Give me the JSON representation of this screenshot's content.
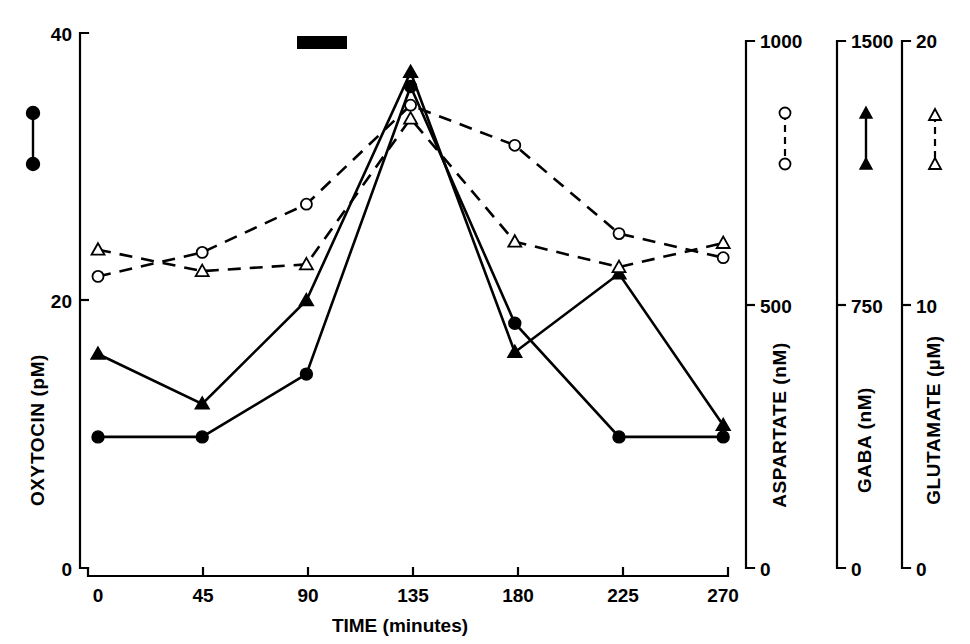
{
  "chart_data": {
    "type": "line",
    "title": "",
    "xlabel": "TIME (minutes)",
    "x": [
      0,
      45,
      90,
      135,
      180,
      225,
      270
    ],
    "xlim": [
      0,
      270
    ],
    "x_ticks": [
      "0",
      "45",
      "90",
      "135",
      "180",
      "225",
      "270"
    ],
    "grid": false,
    "legend_position": "inline-markers",
    "annotations": [
      {
        "name": "stimulation-bar",
        "description": "solid black horizontal bar above plot",
        "x_start": 95,
        "x_end": 113
      }
    ],
    "axes": [
      {
        "id": "oxytocin",
        "label": "OXYTOCIN",
        "units": "(pM)",
        "side": "left",
        "ticks": [
          "0",
          "20",
          "40"
        ],
        "tick_values": [
          0,
          20,
          40
        ],
        "ylim": [
          0,
          40
        ]
      },
      {
        "id": "aspartate",
        "label": "ASPARTATE",
        "units": "(nM)",
        "side": "right",
        "ticks": [
          "0",
          "500",
          "1000"
        ],
        "tick_values": [
          0,
          500,
          1000
        ],
        "ylim": [
          0,
          1000
        ]
      },
      {
        "id": "gaba",
        "label": "GABA",
        "units": "(nM)",
        "side": "right",
        "ticks": [
          "0",
          "750",
          "1500"
        ],
        "tick_values": [
          0,
          750,
          1500
        ],
        "ylim": [
          0,
          1500
        ]
      },
      {
        "id": "glutamate",
        "label": "GLUTAMATE",
        "units": "(µM)",
        "side": "right",
        "ticks": [
          "0",
          "10",
          "20"
        ],
        "tick_values": [
          0,
          10,
          20
        ],
        "ylim": [
          0,
          20
        ]
      }
    ],
    "series": [
      {
        "name": "OXYTOCIN",
        "axis": "oxytocin",
        "marker": "filled-circle",
        "line": "solid",
        "units": "pM",
        "values": [
          9.8,
          9.8,
          14.5,
          36.0,
          18.3,
          9.8,
          9.8
        ]
      },
      {
        "name": "GABA",
        "axis": "gaba",
        "marker": "filled-triangle",
        "line": "solid",
        "units": "nM",
        "values": [
          600,
          460,
          750,
          1390,
          605,
          825,
          400
        ]
      },
      {
        "name": "ASPARTATE",
        "axis": "aspartate",
        "marker": "open-circle",
        "line": "dashed",
        "units": "nM",
        "values": [
          545,
          590,
          680,
          865,
          790,
          625,
          580
        ]
      },
      {
        "name": "GLUTAMATE",
        "axis": "glutamate",
        "marker": "open-triangle",
        "line": "dashed",
        "units": "µM",
        "values": [
          11.9,
          11.1,
          11.35,
          16.8,
          12.2,
          11.25,
          12.15
        ]
      }
    ]
  },
  "legend_markers": [
    {
      "name": "oxytocin-legend-marker",
      "marker": "filled-circle",
      "line": "solid"
    },
    {
      "name": "aspartate-legend-marker",
      "marker": "open-circle",
      "line": "dashed"
    },
    {
      "name": "gaba-legend-marker",
      "marker": "filled-triangle",
      "line": "solid"
    },
    {
      "name": "glutamate-legend-marker",
      "marker": "open-triangle",
      "line": "dashed"
    }
  ],
  "labels": {
    "oxytocin_axis_title": "OXYTOCIN   (pM)",
    "aspartate_axis_title": "ASPARTATE   (nM)",
    "gaba_axis_title": "GABA   (nM)",
    "glutamate_axis_title": "GLUTAMATE   (µM)",
    "x_axis_title": "TIME (minutes)",
    "oxytocin_tick_top": "40",
    "oxytocin_tick_mid": "20",
    "oxytocin_tick_bottom": "0",
    "aspartate_tick_top": "1000",
    "aspartate_tick_mid": "500",
    "aspartate_tick_bottom": "0",
    "gaba_tick_top": "1500",
    "gaba_tick_mid": "750",
    "gaba_tick_bottom": "0",
    "glutamate_tick_top": "20",
    "glutamate_tick_mid": "10",
    "glutamate_tick_bottom": "0",
    "x_tick_0": "0",
    "x_tick_45": "45",
    "x_tick_90": "90",
    "x_tick_135": "135",
    "x_tick_180": "180",
    "x_tick_225": "225",
    "x_tick_270": "270"
  },
  "colors": {
    "ink": "#000000",
    "background": "#ffffff"
  }
}
